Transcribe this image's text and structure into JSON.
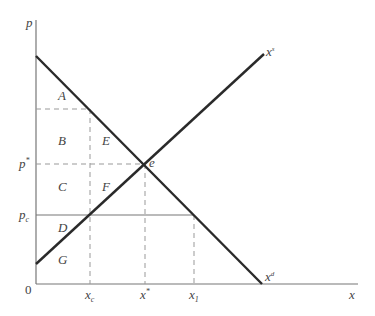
{
  "diagram": {
    "axes": {
      "y_label": "p",
      "x_label": "x",
      "origin_label": "0"
    },
    "curves": {
      "supply_label": "x",
      "supply_sup": "s",
      "demand_label": "x",
      "demand_sup": "d"
    },
    "price_ticks": {
      "p_star": "p",
      "p_star_sup": "*",
      "p_c": "p",
      "p_c_sub": "c"
    },
    "quantity_ticks": {
      "x_c": "x",
      "x_c_sub": "c",
      "x_star": "x",
      "x_star_sup": "*",
      "x_1": "x",
      "x_1_sub": "1"
    },
    "equilibrium_label": "e",
    "regions": {
      "A": "A",
      "B": "B",
      "C": "C",
      "D": "D",
      "E": "E",
      "F": "F",
      "G": "G"
    },
    "colors": {
      "curve": "#2a2a2a",
      "axis": "#777777",
      "dashed": "#999999",
      "text": "#444444"
    }
  }
}
